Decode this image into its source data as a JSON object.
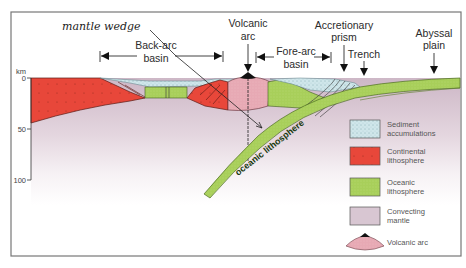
{
  "diagram": {
    "title_annotation": "mantle wedge",
    "axis": {
      "unit_label": "km",
      "ticks": [
        "0",
        "50",
        "100"
      ]
    },
    "labels": {
      "volcanic_arc_line1": "Volcanic",
      "volcanic_arc_line2": "arc",
      "back_arc_line1": "Back-arc",
      "back_arc_line2": "basin",
      "fore_arc_line1": "Fore-arc",
      "fore_arc_line2": "basin",
      "accretionary_line1": "Accretionary",
      "accretionary_line2": "prism",
      "trench": "Trench",
      "abyssal_line1": "Abyssal",
      "abyssal_line2": "plain",
      "slab": "oceanic lithosphere"
    },
    "legend": [
      {
        "id": "sediment",
        "line1": "Sediment",
        "line2": "accumulations",
        "color": "#cfe6ea"
      },
      {
        "id": "continental",
        "line1": "Continental",
        "line2": "lithosphere",
        "color": "#e8473a"
      },
      {
        "id": "oceanic",
        "line1": "Oceanic",
        "line2": "lithosphere",
        "color": "#a8cf5a"
      },
      {
        "id": "mantle",
        "line1": "Convecting",
        "line2": "mantle",
        "color": "#d8c6d2"
      },
      {
        "id": "volcanic",
        "line1": "Volcanic arc",
        "line2": "",
        "color": "#e7a9b4"
      }
    ],
    "colors": {
      "continental": "#e8473a",
      "oceanic": "#a8cf5a",
      "mantle": "#d8c6d2",
      "sediment": "#cfe6ea",
      "volcanic": "#e7a9b4",
      "frame": "#777777"
    }
  }
}
